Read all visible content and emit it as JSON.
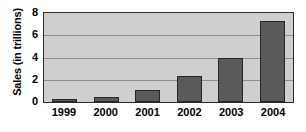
{
  "chart_data": {
    "type": "bar",
    "title": "",
    "xlabel": "",
    "ylabel": "Sales (in trillions)",
    "categories": [
      "1999",
      "2000",
      "2001",
      "2002",
      "2003",
      "2004"
    ],
    "values": [
      0.25,
      0.45,
      1.1,
      2.3,
      4.0,
      7.3
    ],
    "series": [
      {
        "name": "Sales",
        "values": [
          0.25,
          0.45,
          1.1,
          2.3,
          4.0,
          7.3
        ]
      }
    ],
    "ylim": [
      0,
      8
    ],
    "yticks": [
      0,
      2,
      4,
      6,
      8
    ],
    "ytick_labels": [
      "0",
      "2",
      "4",
      "6",
      "8"
    ],
    "grid": true,
    "grid_axis": "y",
    "legend": false,
    "legend_position": "none",
    "colors": {
      "bar_fill": "#5a5a5a",
      "bar_edge": "#262626",
      "plot_background": "#cfcfcf",
      "grid_line": "#8e8e8e",
      "axis_line": "#2b2b2b",
      "text": "#000000",
      "figure_background": "#ffffff"
    }
  }
}
